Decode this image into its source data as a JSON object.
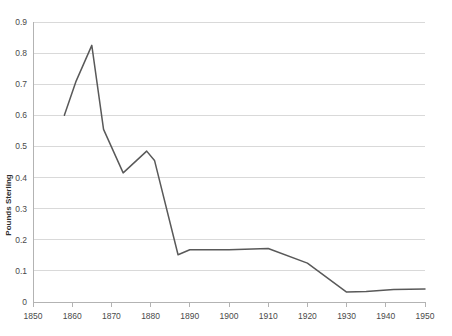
{
  "chart_data": {
    "type": "line",
    "title": "",
    "xlabel": "",
    "ylabel": "Pounds Sterling",
    "xlim": [
      1850,
      1950
    ],
    "ylim": [
      0,
      0.9
    ],
    "grid": true,
    "legend": false,
    "legend_position": "none",
    "line_color": "#595959",
    "gridline_color": "#d9d9d9",
    "axis_color": "#b3b3b3",
    "xticks": [
      1850,
      1860,
      1870,
      1880,
      1890,
      1900,
      1910,
      1920,
      1930,
      1940,
      1950
    ],
    "xtick_labels": [
      "1850",
      "1860",
      "1870",
      "1880",
      "1890",
      "1900",
      "1910",
      "1920",
      "1930",
      "1940",
      "1950"
    ],
    "yticks": [
      0,
      0.1,
      0.2,
      0.3,
      0.4,
      0.5,
      0.6,
      0.7,
      0.8,
      0.9
    ],
    "ytick_labels": [
      "0",
      "0.1",
      "0.2",
      "0.3",
      "0.4",
      "0.5",
      "0.6",
      "0.7",
      "0.8",
      "0.9"
    ],
    "series": [
      {
        "name": "Pounds Sterling",
        "x": [
          1858,
          1861,
          1865,
          1868,
          1873,
          1879,
          1881,
          1887,
          1890,
          1900,
          1910,
          1920,
          1930,
          1935,
          1942,
          1950
        ],
        "values": [
          0.6,
          0.71,
          0.825,
          0.555,
          0.415,
          0.485,
          0.455,
          0.152,
          0.168,
          0.168,
          0.172,
          0.125,
          0.032,
          0.034,
          0.04,
          0.042
        ]
      }
    ]
  }
}
